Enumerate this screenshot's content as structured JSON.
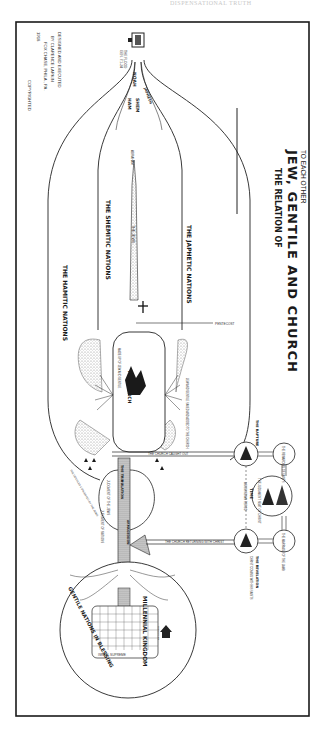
{
  "page": {
    "header_text": "DISPENSATIONAL TRUTH"
  },
  "title": {
    "line1": "THE RELATION OF",
    "line2": "JEW, GENTILE AND CHURCH",
    "line3": "TO EACH OTHER"
  },
  "credit": {
    "line1": "DESIGNED AND EXECUTED",
    "line2": "BY CLARENCE LARKIN",
    "line3": "FOX CHASE, PHILA., PA.",
    "line4": "1918",
    "copyright": "COPYRIGHTED"
  },
  "flood": {
    "label": "THE FLOOD",
    "ref": "GEN. 7:1-24"
  },
  "sons_of_noah": {
    "noah": "NOAH",
    "shem": "SHEM",
    "ham": "HAM",
    "japheth": "JAPHETH"
  },
  "streams": {
    "japhetic": "THE JAPHETIC NATIONS",
    "shemitic": "THE SHEMITIC NATIONS",
    "hamitic": "THE HAMITIC NATIONS",
    "jews": "THE JEWS",
    "abraham": "ABRAHAM"
  },
  "events": {
    "pentecost": "PENTECOST",
    "church": "THE CHURCH",
    "church_ref": "MADE UP OF JEW AND GENTILE",
    "jew_gentile_saved": "JEW AND GENTILE SAVED AND ADDED TO THE CHURCH",
    "church_caught_out": "THE CHURCH CAUGHT OUT",
    "church_returning": "THE CHURCH RETURNING WITH CHRIST",
    "tribulation": "THE TRIBULATION",
    "armageddon": "ARMAGEDDON",
    "judgment_jews": "JUDGMENT OF THE JEWS",
    "judgment_nations": "JUDGMENT OF NATIONS",
    "restoration": "RESTORATION OF ISRAEL",
    "gentile_converted": "THE GENTILES CONVERTED BY THE JEWS"
  },
  "side_panel": {
    "rapture": "THE RAPTURE",
    "judgment_seat": "THE JUDGMENT SEAT OF CHRIST",
    "time_label": "TIME",
    "time_sub": "AN UNKNOWN PERIOD",
    "marriage": "THE MARRIAGE OF THE LAMB",
    "revelation": "THE REVELATION",
    "revelation_sub": "CHRIST COMING WITH HIS SAINTS",
    "reward": "THE REWARDING OF SAINTS"
  },
  "kingdom": {
    "millennial": "MILLENNIAL KINGDOM",
    "gentile_blessing": "GENTILE NATIONS IN BLESSING",
    "israel_supreme": "ISRAEL SUPREME",
    "jerusalem": "JERUSALEM"
  },
  "colors": {
    "ink": "#1a1a1a",
    "paper": "#ffffff",
    "stipple": "#9a9a9a"
  }
}
